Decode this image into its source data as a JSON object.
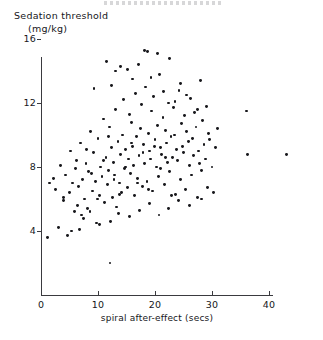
{
  "figure": {
    "top_edge_artifact": "cut-off-header-text"
  },
  "chart_data": {
    "type": "scatter",
    "title": "",
    "ylabel_line1": "Sedation threshold",
    "ylabel_line2": "(mg/kg)",
    "xlabel": "spiral after-effect (secs)",
    "xticks": [
      0,
      10,
      20,
      30,
      40
    ],
    "yticks": [
      4,
      8,
      12,
      16
    ],
    "xlim": [
      0,
      44
    ],
    "ylim": [
      0,
      16.8
    ],
    "grid": false,
    "legend": null,
    "marker_color": "#17171b",
    "axis_color": "#3a3a3f",
    "points": [
      [
        1.5,
        7.0
      ],
      [
        1.2,
        3.6
      ],
      [
        2.2,
        7.3
      ],
      [
        2.6,
        6.6
      ],
      [
        3.0,
        4.2
      ],
      [
        3.4,
        8.1
      ],
      [
        3.9,
        5.9
      ],
      [
        4.3,
        7.5
      ],
      [
        4.6,
        3.7
      ],
      [
        5.0,
        6.4
      ],
      [
        5.2,
        9.0
      ],
      [
        5.6,
        7.0
      ],
      [
        5.9,
        5.2
      ],
      [
        6.2,
        8.4
      ],
      [
        6.5,
        6.8
      ],
      [
        6.8,
        4.1
      ],
      [
        7.0,
        9.5
      ],
      [
        7.3,
        7.2
      ],
      [
        7.6,
        6.0
      ],
      [
        7.9,
        8.2
      ],
      [
        8.1,
        5.4
      ],
      [
        8.4,
        7.7
      ],
      [
        8.7,
        10.2
      ],
      [
        9.0,
        6.5
      ],
      [
        9.2,
        8.9
      ],
      [
        9.5,
        7.1
      ],
      [
        9.7,
        4.5
      ],
      [
        10.0,
        9.8
      ],
      [
        10.2,
        6.2
      ],
      [
        10.5,
        8.0
      ],
      [
        10.7,
        7.4
      ],
      [
        11.0,
        11.0
      ],
      [
        11.2,
        5.8
      ],
      [
        11.4,
        8.6
      ],
      [
        11.6,
        6.9
      ],
      [
        11.8,
        7.8
      ],
      [
        12.0,
        10.5
      ],
      [
        12.1,
        2.0
      ],
      [
        12.3,
        9.2
      ],
      [
        12.5,
        6.1
      ],
      [
        12.7,
        8.3
      ],
      [
        12.9,
        7.5
      ],
      [
        13.1,
        11.6
      ],
      [
        13.3,
        5.5
      ],
      [
        13.5,
        9.6
      ],
      [
        13.7,
        7.0
      ],
      [
        13.9,
        8.8
      ],
      [
        14.1,
        6.4
      ],
      [
        14.3,
        10.0
      ],
      [
        14.5,
        12.2
      ],
      [
        14.7,
        7.9
      ],
      [
        14.9,
        9.1
      ],
      [
        15.1,
        6.7
      ],
      [
        15.3,
        8.5
      ],
      [
        15.5,
        11.3
      ],
      [
        15.7,
        7.6
      ],
      [
        15.9,
        10.8
      ],
      [
        16.0,
        9.3
      ],
      [
        16.2,
        8.1
      ],
      [
        16.4,
        6.2
      ],
      [
        16.6,
        12.6
      ],
      [
        16.8,
        9.9
      ],
      [
        17.0,
        7.3
      ],
      [
        17.2,
        8.7
      ],
      [
        17.4,
        10.4
      ],
      [
        17.6,
        11.9
      ],
      [
        17.8,
        6.8
      ],
      [
        18.0,
        9.4
      ],
      [
        18.2,
        8.2
      ],
      [
        18.4,
        13.0
      ],
      [
        18.6,
        7.1
      ],
      [
        18.8,
        10.1
      ],
      [
        19.0,
        9.0
      ],
      [
        19.2,
        8.5
      ],
      [
        19.4,
        11.5
      ],
      [
        19.6,
        6.5
      ],
      [
        19.8,
        12.4
      ],
      [
        20.0,
        9.7
      ],
      [
        20.2,
        8.0
      ],
      [
        20.4,
        10.6
      ],
      [
        20.6,
        7.4
      ],
      [
        20.8,
        13.8
      ],
      [
        21.0,
        9.2
      ],
      [
        21.2,
        8.8
      ],
      [
        21.4,
        11.1
      ],
      [
        21.6,
        6.9
      ],
      [
        21.8,
        10.3
      ],
      [
        22.0,
        9.5
      ],
      [
        22.2,
        8.3
      ],
      [
        22.4,
        12.0
      ],
      [
        22.6,
        7.7
      ],
      [
        22.8,
        9.9
      ],
      [
        23.0,
        8.6
      ],
      [
        23.2,
        11.7
      ],
      [
        23.4,
        10.0
      ],
      [
        23.6,
        6.3
      ],
      [
        23.8,
        9.1
      ],
      [
        24.0,
        8.4
      ],
      [
        24.2,
        12.8
      ],
      [
        24.4,
        7.2
      ],
      [
        24.6,
        10.7
      ],
      [
        24.8,
        9.3
      ],
      [
        25.0,
        8.9
      ],
      [
        25.2,
        11.2
      ],
      [
        25.4,
        6.6
      ],
      [
        25.6,
        10.2
      ],
      [
        25.8,
        9.6
      ],
      [
        26.0,
        8.1
      ],
      [
        26.2,
        12.3
      ],
      [
        26.4,
        7.5
      ],
      [
        26.6,
        9.8
      ],
      [
        26.8,
        8.7
      ],
      [
        27.0,
        11.4
      ],
      [
        27.2,
        10.5
      ],
      [
        27.4,
        6.1
      ],
      [
        27.6,
        9.0
      ],
      [
        27.8,
        8.2
      ],
      [
        28.0,
        13.4
      ],
      [
        28.2,
        7.8
      ],
      [
        28.4,
        10.9
      ],
      [
        28.6,
        9.4
      ],
      [
        28.8,
        8.5
      ],
      [
        29.0,
        11.8
      ],
      [
        29.2,
        6.7
      ],
      [
        29.4,
        10.1
      ],
      [
        29.6,
        9.7
      ],
      [
        30.0,
        8.0
      ],
      [
        30.3,
        6.4
      ],
      [
        30.6,
        9.2
      ],
      [
        31.0,
        10.4
      ],
      [
        4.0,
        6.1
      ],
      [
        5.4,
        4.0
      ],
      [
        6.0,
        7.9
      ],
      [
        7.1,
        5.0
      ],
      [
        8.0,
        9.1
      ],
      [
        8.9,
        7.6
      ],
      [
        9.9,
        6.0
      ],
      [
        10.9,
        8.4
      ],
      [
        11.9,
        9.9
      ],
      [
        12.8,
        7.2
      ],
      [
        13.8,
        6.3
      ],
      [
        14.8,
        8.0
      ],
      [
        15.8,
        9.5
      ],
      [
        16.9,
        7.0
      ],
      [
        17.9,
        8.9
      ],
      [
        18.9,
        6.6
      ],
      [
        19.9,
        9.3
      ],
      [
        20.9,
        7.9
      ],
      [
        21.9,
        8.6
      ],
      [
        22.9,
        6.2
      ],
      [
        9.3,
        12.9
      ],
      [
        11.5,
        14.6
      ],
      [
        13.0,
        14.0
      ],
      [
        14.0,
        14.3
      ],
      [
        15.2,
        14.1
      ],
      [
        16.1,
        13.5
      ],
      [
        17.1,
        14.4
      ],
      [
        18.1,
        15.3
      ],
      [
        18.7,
        15.2
      ],
      [
        20.5,
        15.1
      ],
      [
        21.5,
        12.7
      ],
      [
        22.5,
        14.8
      ],
      [
        24.5,
        13.2
      ],
      [
        25.5,
        12.5
      ],
      [
        27.5,
        11.6
      ],
      [
        12.4,
        13.1
      ],
      [
        19.3,
        13.6
      ],
      [
        23.5,
        12.1
      ],
      [
        6.4,
        5.6
      ],
      [
        7.4,
        4.8
      ],
      [
        8.6,
        5.2
      ],
      [
        10.3,
        4.4
      ],
      [
        12.2,
        4.6
      ],
      [
        13.6,
        5.1
      ],
      [
        15.6,
        4.9
      ],
      [
        17.3,
        5.3
      ],
      [
        19.1,
        5.7
      ],
      [
        20.7,
        5.0
      ],
      [
        22.3,
        5.4
      ],
      [
        24.1,
        5.9
      ],
      [
        26.1,
        5.6
      ],
      [
        28.1,
        6.0
      ],
      [
        36.0,
        11.5
      ],
      [
        36.2,
        8.8
      ],
      [
        43.0,
        8.8
      ]
    ]
  }
}
